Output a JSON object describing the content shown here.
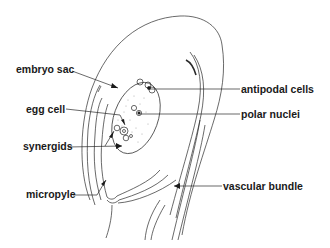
{
  "diagram": {
    "labels": {
      "embryo_sac": "embryo sac",
      "egg_cell": "egg cell",
      "synergids": "synergids",
      "micropyle": "micropyle",
      "antipodal_cells": "antipodal cells",
      "polar_nuclei": "polar nuclei",
      "vascular_bundle": "vascular bundle"
    },
    "colors": {
      "line": "#2a2a2a",
      "text": "#1a1a1a",
      "background": "#ffffff",
      "stipple": "#9a9a9a"
    }
  }
}
